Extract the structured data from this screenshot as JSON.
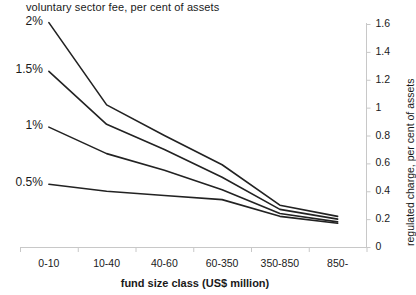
{
  "chart_data": {
    "type": "line",
    "title": "voluntary sector fee, per cent of assets",
    "xlabel": "fund size class (US$ million)",
    "ylabel": "regulated charge, per cent of assets",
    "categories": [
      "0-10",
      "10-40",
      "40-60",
      "60-350",
      "350-850",
      "850-"
    ],
    "series": [
      {
        "name": "2%",
        "label": "2%",
        "values": [
          1.61,
          1.02,
          0.8,
          0.59,
          0.3,
          0.22
        ]
      },
      {
        "name": "1.5%",
        "label": "1.5%",
        "values": [
          1.26,
          0.88,
          0.7,
          0.5,
          0.27,
          0.2
        ]
      },
      {
        "name": "1%",
        "label": "1%",
        "values": [
          0.86,
          0.67,
          0.55,
          0.41,
          0.24,
          0.18
        ]
      },
      {
        "name": "0.5%",
        "label": "0.5%",
        "values": [
          0.45,
          0.4,
          0.37,
          0.34,
          0.22,
          0.17
        ]
      }
    ],
    "yticks": [
      "1.6",
      "1.4",
      "1.2",
      "1",
      "0.8",
      "0.6",
      "0.4",
      "0.2",
      "0"
    ],
    "ytick_values": [
      1.6,
      1.4,
      1.2,
      1.0,
      0.8,
      0.6,
      0.4,
      0.2,
      0.0
    ],
    "ylim": [
      0,
      1.6
    ],
    "yaxis_position": "right",
    "grid": false,
    "legend": "inline-series-labels",
    "line_color": "#222222",
    "axis_color": "#c8c8c8"
  }
}
